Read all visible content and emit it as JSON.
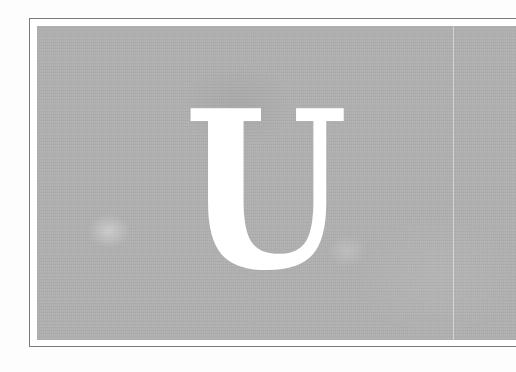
{
  "image": {
    "letter": "U",
    "panel_color": "#b0b0b0",
    "letter_color": "#ffffff",
    "frame_color": "#7a7a7a"
  }
}
